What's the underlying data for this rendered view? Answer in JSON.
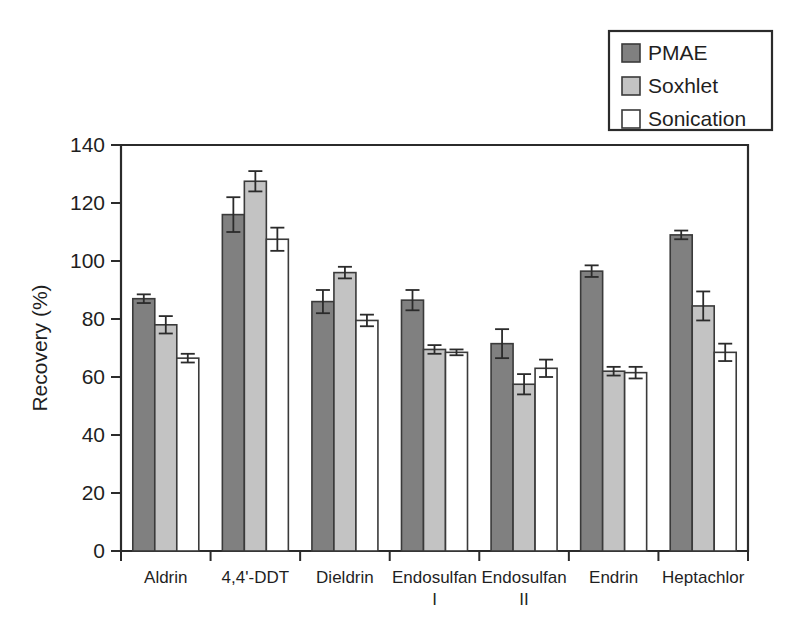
{
  "chart_data": {
    "type": "bar",
    "title": "",
    "xlabel": "",
    "ylabel": "Recovery (%)",
    "ylim": [
      0,
      140
    ],
    "yticks": [
      0,
      20,
      40,
      60,
      80,
      100,
      120,
      140
    ],
    "grid": false,
    "legend_position": "top-right",
    "categories": [
      "Aldrin",
      "4,4'-DDT",
      "Dieldrin",
      "Endosulfan I",
      "Endosulfan II",
      "Endrin",
      "Heptachlor"
    ],
    "category_lines": [
      [
        "Aldrin",
        ""
      ],
      [
        "4,4'-DDT",
        ""
      ],
      [
        "Dieldrin",
        ""
      ],
      [
        "Endosulfan",
        "I"
      ],
      [
        "Endosulfan",
        "II"
      ],
      [
        "Endrin",
        ""
      ],
      [
        "Heptachlor",
        ""
      ]
    ],
    "series": [
      {
        "name": "PMAE",
        "color": "#808080",
        "values": [
          87,
          116,
          86,
          86.5,
          71.5,
          96.5,
          109
        ],
        "errors": [
          1.5,
          6,
          4,
          3.5,
          5,
          2,
          1.5
        ]
      },
      {
        "name": "Soxhlet",
        "color": "#c3c3c3",
        "values": [
          78,
          127.5,
          96,
          69.5,
          57.5,
          62,
          84.5
        ]
      },
      {
        "name": "Sonication",
        "color": "#ffffff",
        "values": [
          66.5,
          107.5,
          79.5,
          68.5,
          63,
          61.5,
          68.5
        ],
        "errors": [
          1.5,
          4,
          2,
          1,
          3,
          2,
          3
        ]
      }
    ],
    "series_errors": {
      "Soxhlet": [
        3,
        3.5,
        2,
        1.5,
        3.5,
        1.5,
        5
      ]
    }
  },
  "legend": {
    "entries": [
      {
        "label": "PMAE",
        "color": "#808080"
      },
      {
        "label": "Soxhlet",
        "color": "#c3c3c3"
      },
      {
        "label": "Sonication",
        "color": "#ffffff"
      }
    ]
  },
  "axes": {
    "y_title": "Recovery (%)",
    "y_tick_labels": [
      "0",
      "20",
      "40",
      "60",
      "80",
      "100",
      "120",
      "140"
    ]
  }
}
